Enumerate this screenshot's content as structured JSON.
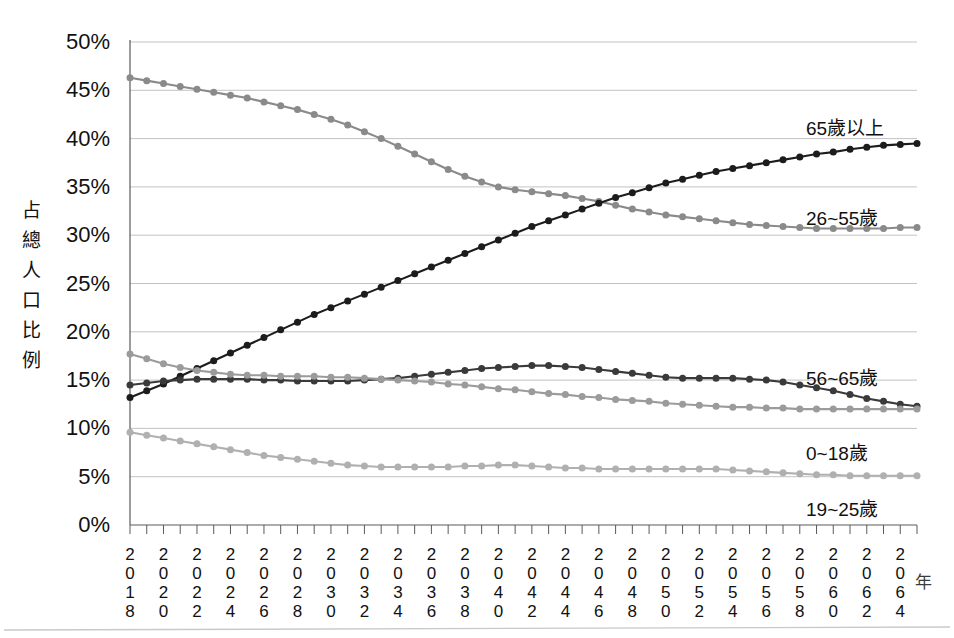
{
  "chart_data": {
    "type": "line",
    "title": "",
    "xlabel": "年",
    "ylabel": "占總人口比例",
    "ylim": [
      0,
      50
    ],
    "ytick_labels": [
      "0%",
      "5%",
      "10%",
      "15%",
      "20%",
      "25%",
      "30%",
      "35%",
      "40%",
      "45%",
      "50%"
    ],
    "ytick_values": [
      0,
      5,
      10,
      15,
      20,
      25,
      30,
      35,
      40,
      45,
      50
    ],
    "grid": true,
    "legend_position": "inline-right",
    "x": [
      2018,
      2019,
      2020,
      2021,
      2022,
      2023,
      2024,
      2025,
      2026,
      2027,
      2028,
      2029,
      2030,
      2031,
      2032,
      2033,
      2034,
      2035,
      2036,
      2037,
      2038,
      2039,
      2040,
      2041,
      2042,
      2043,
      2044,
      2045,
      2046,
      2047,
      2048,
      2049,
      2050,
      2051,
      2052,
      2053,
      2054,
      2055,
      2056,
      2057,
      2058,
      2059,
      2060,
      2061,
      2062,
      2063,
      2064,
      2065
    ],
    "xtick_labels": [
      "2018",
      "2020",
      "2022",
      "2024",
      "2026",
      "2028",
      "2030",
      "2032",
      "2034",
      "2036",
      "2038",
      "2040",
      "2042",
      "2044",
      "2046",
      "2048",
      "2050",
      "2052",
      "2054",
      "2056",
      "2058",
      "2060",
      "2062",
      "2064"
    ],
    "series": [
      {
        "name": "26~55歲",
        "color": "#8a8a8a",
        "label_x": 806,
        "label_y": 203,
        "values": [
          46.3,
          46.0,
          45.7,
          45.4,
          45.1,
          44.8,
          44.5,
          44.2,
          43.8,
          43.4,
          43.0,
          42.5,
          42.0,
          41.4,
          40.7,
          40.0,
          39.2,
          38.4,
          37.6,
          36.8,
          36.1,
          35.5,
          35.0,
          34.7,
          34.5,
          34.3,
          34.1,
          33.8,
          33.5,
          33.1,
          32.7,
          32.4,
          32.1,
          31.9,
          31.7,
          31.5,
          31.3,
          31.1,
          31.0,
          30.9,
          30.8,
          30.7,
          30.7,
          30.7,
          30.7,
          30.7,
          30.8,
          30.8
        ]
      },
      {
        "name": "65歲以上",
        "color": "#1c1c1c",
        "label_x": 806,
        "label_y": 113,
        "values": [
          13.2,
          13.9,
          14.6,
          15.4,
          16.2,
          17.0,
          17.8,
          18.6,
          19.4,
          20.2,
          21.0,
          21.8,
          22.5,
          23.2,
          23.9,
          24.6,
          25.3,
          26.0,
          26.7,
          27.4,
          28.1,
          28.8,
          29.5,
          30.2,
          30.9,
          31.5,
          32.1,
          32.7,
          33.3,
          33.9,
          34.4,
          34.9,
          35.4,
          35.8,
          36.2,
          36.6,
          36.9,
          37.2,
          37.5,
          37.8,
          38.1,
          38.4,
          38.6,
          38.9,
          39.1,
          39.3,
          39.4,
          39.5
        ]
      },
      {
        "name": "56~65歲",
        "color": "#3a3a3a",
        "label_x": 806,
        "label_y": 363,
        "values": [
          14.5,
          14.7,
          14.9,
          15.0,
          15.1,
          15.1,
          15.1,
          15.1,
          15.0,
          15.0,
          14.9,
          14.9,
          14.9,
          14.9,
          15.0,
          15.1,
          15.2,
          15.4,
          15.6,
          15.8,
          16.0,
          16.2,
          16.3,
          16.4,
          16.5,
          16.5,
          16.4,
          16.3,
          16.1,
          15.9,
          15.7,
          15.5,
          15.3,
          15.2,
          15.2,
          15.2,
          15.2,
          15.1,
          15.0,
          14.8,
          14.5,
          14.2,
          13.9,
          13.5,
          13.1,
          12.8,
          12.5,
          12.3
        ]
      },
      {
        "name": "0~18歲",
        "color": "#9b9b9b",
        "label_x": 806,
        "label_y": 438,
        "values": [
          17.7,
          17.2,
          16.7,
          16.3,
          16.0,
          15.8,
          15.6,
          15.5,
          15.5,
          15.4,
          15.4,
          15.4,
          15.3,
          15.3,
          15.2,
          15.1,
          15.0,
          14.9,
          14.8,
          14.6,
          14.5,
          14.3,
          14.1,
          14.0,
          13.8,
          13.6,
          13.5,
          13.3,
          13.2,
          13.0,
          12.9,
          12.8,
          12.6,
          12.5,
          12.4,
          12.3,
          12.2,
          12.2,
          12.1,
          12.1,
          12.0,
          12.0,
          12.0,
          12.0,
          12.0,
          12.0,
          12.0,
          12.0
        ]
      },
      {
        "name": "19~25歲",
        "color": "#b0b0b0",
        "label_x": 806,
        "label_y": 494,
        "values": [
          9.6,
          9.3,
          9.0,
          8.7,
          8.4,
          8.1,
          7.8,
          7.5,
          7.2,
          7.0,
          6.8,
          6.6,
          6.4,
          6.2,
          6.1,
          6.0,
          6.0,
          6.0,
          6.0,
          6.0,
          6.1,
          6.1,
          6.2,
          6.2,
          6.1,
          6.0,
          5.9,
          5.9,
          5.8,
          5.8,
          5.8,
          5.8,
          5.8,
          5.8,
          5.8,
          5.8,
          5.7,
          5.6,
          5.5,
          5.4,
          5.3,
          5.2,
          5.2,
          5.1,
          5.1,
          5.1,
          5.1,
          5.1
        ]
      }
    ]
  },
  "axes": {
    "y_title_chars": [
      "占",
      "總",
      "人",
      "口",
      "比",
      "例"
    ],
    "x_title": "年"
  }
}
